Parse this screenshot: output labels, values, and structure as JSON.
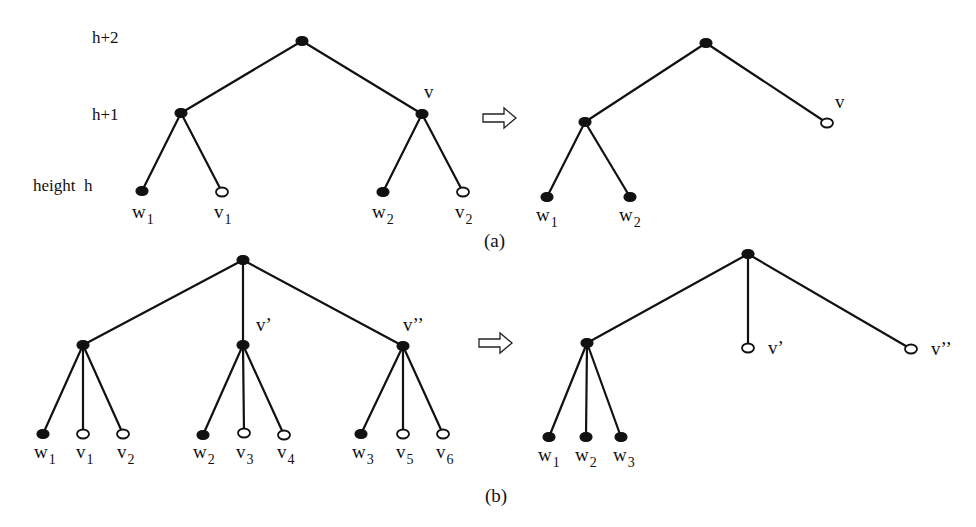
{
  "level_labels": [
    {
      "text": "h+2",
      "x": 92,
      "y": 43
    },
    {
      "text": "h+1",
      "x": 92,
      "y": 120
    },
    {
      "text": "height  h",
      "x": 33,
      "y": 191
    }
  ],
  "captions": {
    "a": "(a)",
    "b": "(b)"
  },
  "panels": [
    {
      "id": "a-before",
      "nodes": [
        {
          "id": "a1-root",
          "x": 302,
          "y": 41,
          "type": "filled"
        },
        {
          "id": "a1-l",
          "x": 181,
          "y": 113,
          "type": "filled"
        },
        {
          "id": "a1-v",
          "x": 422,
          "y": 114,
          "type": "filled",
          "label": "v",
          "lx": 424,
          "ly": 98
        },
        {
          "id": "a1-w1",
          "x": 142,
          "y": 191,
          "type": "filled",
          "label": "w",
          "sub": "1",
          "lx": 132,
          "ly": 218
        },
        {
          "id": "a1-v1",
          "x": 222,
          "y": 192,
          "type": "open",
          "label": "v",
          "sub": "1",
          "lx": 214,
          "ly": 218
        },
        {
          "id": "a1-w2",
          "x": 383,
          "y": 192,
          "type": "filled",
          "label": "w",
          "sub": "2",
          "lx": 372,
          "ly": 218
        },
        {
          "id": "a1-v2",
          "x": 463,
          "y": 192,
          "type": "open",
          "label": "v",
          "sub": "2",
          "lx": 455,
          "ly": 218
        }
      ],
      "edges": [
        [
          "a1-root",
          "a1-l"
        ],
        [
          "a1-root",
          "a1-v"
        ],
        [
          "a1-l",
          "a1-w1"
        ],
        [
          "a1-l",
          "a1-v1"
        ],
        [
          "a1-v",
          "a1-w2"
        ],
        [
          "a1-v",
          "a1-v2"
        ]
      ]
    },
    {
      "id": "a-after",
      "nodes": [
        {
          "id": "a2-root",
          "x": 706,
          "y": 43,
          "type": "filled"
        },
        {
          "id": "a2-l",
          "x": 585,
          "y": 122,
          "type": "filled"
        },
        {
          "id": "a2-v",
          "x": 827,
          "y": 123,
          "type": "open",
          "label": "v",
          "lx": 835,
          "ly": 108
        },
        {
          "id": "a2-w1",
          "x": 547,
          "y": 197,
          "type": "filled",
          "label": "w",
          "sub": "1",
          "lx": 536,
          "ly": 221
        },
        {
          "id": "a2-w2",
          "x": 630,
          "y": 197,
          "type": "filled",
          "label": "w",
          "sub": "2",
          "lx": 619,
          "ly": 221
        }
      ],
      "edges": [
        [
          "a2-root",
          "a2-l"
        ],
        [
          "a2-root",
          "a2-v"
        ],
        [
          "a2-l",
          "a2-w1"
        ],
        [
          "a2-l",
          "a2-w2"
        ]
      ]
    },
    {
      "id": "b-before",
      "nodes": [
        {
          "id": "b1-root",
          "x": 243,
          "y": 260,
          "type": "filled"
        },
        {
          "id": "b1-a",
          "x": 83,
          "y": 345,
          "type": "filled"
        },
        {
          "id": "b1-b",
          "x": 243,
          "y": 345,
          "type": "filled",
          "label": "v’",
          "lx": 256,
          "ly": 331
        },
        {
          "id": "b1-c",
          "x": 403,
          "y": 346,
          "type": "filled",
          "label": "v’’",
          "lx": 403,
          "ly": 331
        },
        {
          "id": "b1-w1",
          "x": 43,
          "y": 434,
          "type": "filled",
          "label": "w",
          "sub": "1",
          "lx": 34,
          "ly": 458
        },
        {
          "id": "b1-v1",
          "x": 83,
          "y": 434,
          "type": "open",
          "label": "v",
          "sub": "1",
          "lx": 76,
          "ly": 458
        },
        {
          "id": "b1-v2",
          "x": 123,
          "y": 434,
          "type": "open",
          "label": "v",
          "sub": "2",
          "lx": 117,
          "ly": 458
        },
        {
          "id": "b1-w2",
          "x": 203,
          "y": 435,
          "type": "filled",
          "label": "w",
          "sub": "2",
          "lx": 193,
          "ly": 458
        },
        {
          "id": "b1-v3",
          "x": 244,
          "y": 433,
          "type": "open",
          "label": "v",
          "sub": "3",
          "lx": 236,
          "ly": 458
        },
        {
          "id": "b1-v4",
          "x": 284,
          "y": 435,
          "type": "open",
          "label": "v",
          "sub": "4",
          "lx": 277,
          "ly": 458
        },
        {
          "id": "b1-w3",
          "x": 361,
          "y": 434,
          "type": "filled",
          "label": "w",
          "sub": "3",
          "lx": 352,
          "ly": 458
        },
        {
          "id": "b1-v5",
          "x": 403,
          "y": 434,
          "type": "open",
          "label": "v",
          "sub": "5",
          "lx": 396,
          "ly": 458
        },
        {
          "id": "b1-v6",
          "x": 443,
          "y": 434,
          "type": "open",
          "label": "v",
          "sub": "6",
          "lx": 436,
          "ly": 458
        }
      ],
      "edges": [
        [
          "b1-root",
          "b1-a"
        ],
        [
          "b1-root",
          "b1-b"
        ],
        [
          "b1-root",
          "b1-c"
        ],
        [
          "b1-a",
          "b1-w1"
        ],
        [
          "b1-a",
          "b1-v1"
        ],
        [
          "b1-a",
          "b1-v2"
        ],
        [
          "b1-b",
          "b1-w2"
        ],
        [
          "b1-b",
          "b1-v3"
        ],
        [
          "b1-b",
          "b1-v4"
        ],
        [
          "b1-c",
          "b1-w3"
        ],
        [
          "b1-c",
          "b1-v5"
        ],
        [
          "b1-c",
          "b1-v6"
        ]
      ]
    },
    {
      "id": "b-after",
      "nodes": [
        {
          "id": "b2-root",
          "x": 748,
          "y": 254,
          "type": "filled"
        },
        {
          "id": "b2-a",
          "x": 587,
          "y": 343,
          "type": "filled"
        },
        {
          "id": "b2-v1",
          "x": 748,
          "y": 348,
          "type": "open",
          "label": "v’",
          "lx": 768,
          "ly": 354
        },
        {
          "id": "b2-v2",
          "x": 911,
          "y": 349,
          "type": "open",
          "label": "v’’",
          "lx": 931,
          "ly": 355
        },
        {
          "id": "b2-w1",
          "x": 549,
          "y": 437,
          "type": "filled",
          "label": "w",
          "sub": "1",
          "lx": 538,
          "ly": 461
        },
        {
          "id": "b2-w2",
          "x": 586,
          "y": 437,
          "type": "filled",
          "label": "w",
          "sub": "2",
          "lx": 575,
          "ly": 461
        },
        {
          "id": "b2-w3",
          "x": 621,
          "y": 437,
          "type": "filled",
          "label": "w",
          "sub": "3",
          "lx": 613,
          "ly": 461
        }
      ],
      "edges": [
        [
          "b2-root",
          "b2-a"
        ],
        [
          "b2-root",
          "b2-v1"
        ],
        [
          "b2-root",
          "b2-v2"
        ],
        [
          "b2-a",
          "b2-w1"
        ],
        [
          "b2-a",
          "b2-w2"
        ],
        [
          "b2-a",
          "b2-w3"
        ]
      ]
    }
  ],
  "arrows": [
    {
      "id": "arrow-a",
      "x": 483,
      "y": 118
    },
    {
      "id": "arrow-b",
      "x": 479,
      "y": 343
    }
  ],
  "caption_pos": {
    "a": {
      "x": 484,
      "y": 247
    },
    "b": {
      "x": 485,
      "y": 502
    }
  }
}
